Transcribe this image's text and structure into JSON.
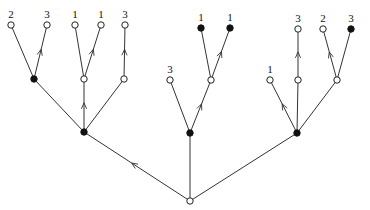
{
  "diagram": {
    "type": "rooted-tree",
    "root": {
      "id": "r",
      "x": 190,
      "y": 201,
      "style": "open"
    },
    "nodes": [
      {
        "id": "A",
        "x": 84,
        "y": 132,
        "style": "filled"
      },
      {
        "id": "B",
        "x": 190,
        "y": 133,
        "style": "filled"
      },
      {
        "id": "C",
        "x": 297,
        "y": 133,
        "style": "filled"
      },
      {
        "id": "A1",
        "x": 34,
        "y": 79,
        "style": "filled"
      },
      {
        "id": "A2",
        "x": 84,
        "y": 79,
        "style": "open"
      },
      {
        "id": "A3",
        "x": 124,
        "y": 79,
        "style": "open"
      },
      {
        "id": "L1",
        "x": 11,
        "y": 25,
        "style": "open",
        "label": "2"
      },
      {
        "id": "L2",
        "x": 47,
        "y": 25,
        "style": "open",
        "label": "3"
      },
      {
        "id": "L3",
        "x": 75,
        "y": 25,
        "style": "open",
        "label": "1"
      },
      {
        "id": "L4",
        "x": 101,
        "y": 25,
        "style": "open",
        "label": "1"
      },
      {
        "id": "L5",
        "x": 125,
        "y": 25,
        "style": "open",
        "label": "3"
      },
      {
        "id": "B1",
        "x": 170,
        "y": 80,
        "style": "open",
        "label": "3"
      },
      {
        "id": "B2",
        "x": 211,
        "y": 80,
        "style": "open"
      },
      {
        "id": "L6",
        "x": 201,
        "y": 28,
        "style": "filled",
        "label": "1"
      },
      {
        "id": "L7",
        "x": 230,
        "y": 28,
        "style": "filled",
        "label": "1"
      },
      {
        "id": "C1",
        "x": 270,
        "y": 80,
        "style": "open",
        "label": "1"
      },
      {
        "id": "C2",
        "x": 298,
        "y": 80,
        "style": "open"
      },
      {
        "id": "C3",
        "x": 337,
        "y": 80,
        "style": "open"
      },
      {
        "id": "L8",
        "x": 298,
        "y": 29,
        "style": "open",
        "label": "3"
      },
      {
        "id": "L9",
        "x": 323,
        "y": 29,
        "style": "open",
        "label": "2"
      },
      {
        "id": "L10",
        "x": 351,
        "y": 29,
        "style": "filled",
        "label": "3"
      }
    ],
    "edges": [
      {
        "from": "r",
        "to": "A",
        "arrow": true
      },
      {
        "from": "r",
        "to": "B",
        "arrow": false
      },
      {
        "from": "r",
        "to": "C",
        "arrow": false
      },
      {
        "from": "A",
        "to": "A1",
        "arrow": false
      },
      {
        "from": "A",
        "to": "A2",
        "arrow": true
      },
      {
        "from": "A",
        "to": "A3",
        "arrow": false
      },
      {
        "from": "A1",
        "to": "L1",
        "arrow": false
      },
      {
        "from": "A1",
        "to": "L2",
        "arrow": true
      },
      {
        "from": "A2",
        "to": "L3",
        "arrow": false
      },
      {
        "from": "A2",
        "to": "L4",
        "arrow": true
      },
      {
        "from": "A3",
        "to": "L5",
        "arrow": true
      },
      {
        "from": "B",
        "to": "B1",
        "arrow": false
      },
      {
        "from": "B",
        "to": "B2",
        "arrow": true
      },
      {
        "from": "B2",
        "to": "L6",
        "arrow": false
      },
      {
        "from": "B2",
        "to": "L7",
        "arrow": true
      },
      {
        "from": "C",
        "to": "C1",
        "arrow": true
      },
      {
        "from": "C",
        "to": "C2",
        "arrow": false
      },
      {
        "from": "C",
        "to": "C3",
        "arrow": false
      },
      {
        "from": "C2",
        "to": "L8",
        "arrow": true
      },
      {
        "from": "C3",
        "to": "L9",
        "arrow": true
      },
      {
        "from": "C3",
        "to": "L10",
        "arrow": false
      }
    ]
  }
}
